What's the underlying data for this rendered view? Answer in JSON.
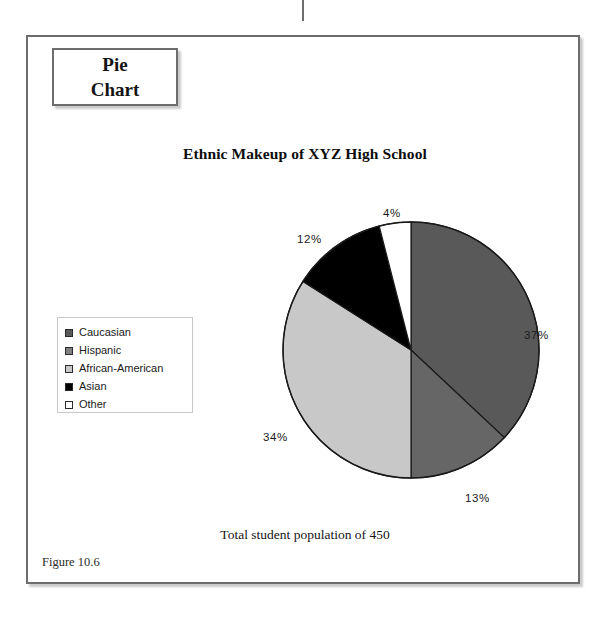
{
  "callout": {
    "name": "pie-chart-callout",
    "line1": "Pie",
    "line2": "Chart"
  },
  "figure": {
    "title": "Ethnic Makeup of XYZ High School",
    "caption": "Total student population of 450",
    "number": "Figure 10.6"
  },
  "legend": {
    "items": [
      {
        "label": "Caucasian",
        "color": "#595959"
      },
      {
        "label": "Hispanic",
        "color": "#808080"
      },
      {
        "label": "African-American",
        "color": "#c8c8c8"
      },
      {
        "label": "Asian",
        "color": "#000000"
      },
      {
        "label": "Other",
        "color": "#ffffff"
      }
    ]
  },
  "labels": {
    "p37": "37%",
    "p13": "13%",
    "p34": "34%",
    "p12": "12%",
    "p4": "4%"
  },
  "chart_data": {
    "type": "pie",
    "title": "Ethnic Makeup of XYZ High School",
    "subtitle": "Total student population of 450",
    "total": 450,
    "unit": "%",
    "legend_position": "left",
    "start_angle": 0,
    "direction": "clockwise",
    "categories": [
      "Caucasian",
      "Hispanic",
      "African-American",
      "Asian",
      "Other"
    ],
    "values": [
      37,
      13,
      34,
      12,
      4
    ],
    "colors": [
      "#595959",
      "#666666",
      "#c8c8c8",
      "#000000",
      "#ffffff"
    ],
    "data_labels": [
      "37%",
      "13%",
      "34%",
      "12%",
      "4%"
    ],
    "slice_counts": [
      167,
      59,
      153,
      54,
      18
    ]
  }
}
